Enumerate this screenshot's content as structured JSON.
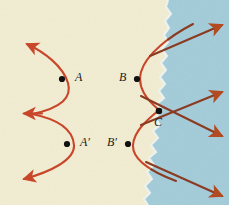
{
  "figure": {
    "canvas": {
      "width": 229,
      "height": 210
    },
    "regions": [
      {
        "name": "left-medium",
        "fill": "#f2edd2",
        "description": "cream colored medium on the left"
      },
      {
        "name": "right-medium",
        "fill": "#a2ccd9",
        "description": "blue colored medium on the right"
      }
    ],
    "boundary": {
      "name": "medium-boundary",
      "style": "ragged torn edge",
      "highlight": "#eef3f4"
    },
    "colors": {
      "wavefront": "#c8472b",
      "ray": "#8a3b22",
      "point": "#111111",
      "label": "#1a1a1a",
      "cream": "#f2edd2",
      "blue": "#a2ccd9",
      "frame": "#ffffff"
    },
    "points": [
      {
        "id": "A",
        "label": "A",
        "x": 62,
        "y": 79,
        "label_x": 76,
        "label_y": 73,
        "side": "left"
      },
      {
        "id": "B",
        "label": "B",
        "x": 137,
        "y": 79,
        "label_x": 120,
        "label_y": 73,
        "side": "left"
      },
      {
        "id": "Ap",
        "label": "A′",
        "x": 67,
        "y": 144,
        "label_x": 81,
        "label_y": 137,
        "side": "left"
      },
      {
        "id": "Bp",
        "label": "B′",
        "x": 128,
        "y": 144,
        "label_x": 108,
        "label_y": 137,
        "side": "left"
      },
      {
        "id": "C",
        "label": "C",
        "x": 159,
        "y": 111,
        "label_x": 155,
        "label_y": 117,
        "side": "right"
      }
    ],
    "wavefronts": [
      {
        "name": "wavefront-upper-left",
        "through": "A",
        "opens": "left"
      },
      {
        "name": "wavefront-lower-left",
        "through": "A′",
        "opens": "left"
      },
      {
        "name": "wavefront-upper-right",
        "through": "B",
        "opens": "left"
      },
      {
        "name": "wavefront-lower-right",
        "through": "B′",
        "opens": "left"
      }
    ],
    "arrows": [
      {
        "name": "arrow-top-left",
        "direction": "up-left",
        "color": "#c8472b"
      },
      {
        "name": "arrow-mid-left-upper",
        "direction": "left",
        "color": "#c8472b"
      },
      {
        "name": "arrow-mid-left-lower",
        "direction": "left",
        "color": "#c8472b"
      },
      {
        "name": "arrow-bottom-left",
        "direction": "down-left",
        "color": "#c8472b"
      },
      {
        "name": "arrow-top-right",
        "direction": "up-right",
        "color": "#8a3b22"
      },
      {
        "name": "arrow-mid-right-upper",
        "direction": "up-right",
        "color": "#8a3b22"
      },
      {
        "name": "arrow-mid-right-lower",
        "direction": "down-right",
        "color": "#8a3b22"
      },
      {
        "name": "arrow-bottom-right",
        "direction": "down-right",
        "color": "#8a3b22"
      }
    ]
  }
}
